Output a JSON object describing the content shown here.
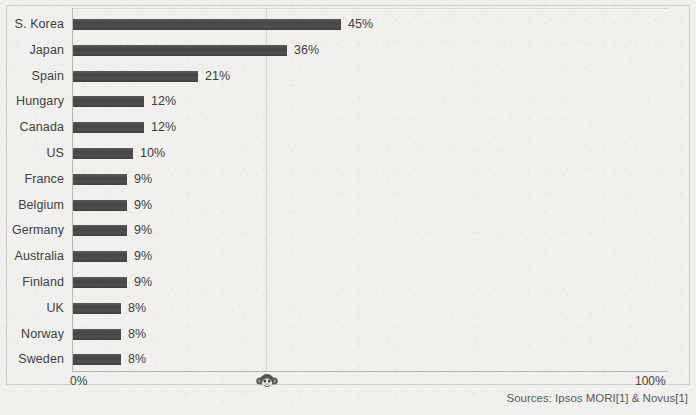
{
  "chart_data": {
    "type": "bar",
    "orientation": "horizontal",
    "title": "",
    "subtitle": "",
    "xlabel": "",
    "ylabel": "",
    "xlim": [
      0,
      100
    ],
    "grid": true,
    "gridlines_at": [
      50
    ],
    "legend": null,
    "value_suffix": "%",
    "categories": [
      "S. Korea",
      "Japan",
      "Spain",
      "Hungary",
      "Canada",
      "US",
      "France",
      "Belgium",
      "Germany",
      "Australia",
      "Finland",
      "UK",
      "Norway",
      "Sweden"
    ],
    "values": [
      45,
      36,
      21,
      12,
      12,
      10,
      9,
      9,
      9,
      9,
      9,
      8,
      8,
      8
    ],
    "value_labels": [
      "45%",
      "36%",
      "21%",
      "12%",
      "12%",
      "10%",
      "9%",
      "9%",
      "9%",
      "9%",
      "9%",
      "8%",
      "8%",
      "8%"
    ],
    "x_tick_labels": [
      "0%",
      "100%"
    ],
    "bar_color": "#4c4c4c",
    "axis_color": "#b9b7b1",
    "text_color": "#40403e",
    "background_color": "#f1f0ed"
  },
  "axis": {
    "tick_min_label": "0%",
    "tick_max_label": "100%"
  },
  "footer": {
    "sources": "Sources: Ipsos MORI[1] & Novus[1]"
  },
  "watermark": {
    "icon": "monkey-face-icon"
  }
}
